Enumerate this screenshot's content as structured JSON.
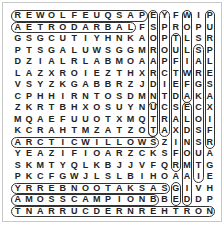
{
  "puzzle": {
    "type": "word-search",
    "rows": 18,
    "cols": 18,
    "grid": [
      "REWOLFEUQSAPEYFWIP",
      "AETRODARBALFSPROPU",
      "GSGCUTIYHNKAOPTLSR",
      "PTSGALUWSGGMROULSP",
      "DZIALRLABMOAAPFIAL",
      "LAZXROIEZTHXRCTWRE",
      "VSYZKGABBRZJDIEFGS",
      "CPHHIRNTOSDMNTDAKA",
      "ZKRTBHXOSUYNUCSECX",
      "MQAEFUUOTXMQTRALOI",
      "KCRAHTMZATZOTAXDSF",
      "ARCTICWILLOWSZINSR",
      "YEAZIFIOARZCKSFOUA",
      "SKMTYQLKBJJVFQRMTG",
      "PKCFGWJLSLBIHOAAIE",
      "YRREBNOOTAKSASGIVH",
      "AMOSSCAMPIONBBEDDP",
      "TNARRUCDERNREHTRON"
    ],
    "highlights": [
      {
        "name": "row1",
        "r": 0,
        "c1": 0,
        "c2": 11,
        "dir": "h"
      },
      {
        "name": "row2",
        "r": 1,
        "c1": 0,
        "c2": 10,
        "dir": "h"
      },
      {
        "name": "arcticwillow",
        "r": 11,
        "c1": 0,
        "c2": 12,
        "dir": "h"
      },
      {
        "name": "row16",
        "r": 15,
        "c1": 0,
        "c2": 13,
        "dir": "h"
      },
      {
        "name": "mosscampion",
        "r": 16,
        "c1": 0,
        "c2": 12,
        "dir": "h"
      },
      {
        "name": "row18",
        "r": 17,
        "c1": 0,
        "c2": 17,
        "dir": "h"
      },
      {
        "name": "col12",
        "c": 12,
        "r1": 0,
        "r2": 10,
        "dir": "v"
      },
      {
        "name": "col13",
        "c": 13,
        "r1": 0,
        "r2": 10,
        "dir": "v"
      },
      {
        "name": "col15",
        "c": 15,
        "r1": 0,
        "r2": 7,
        "dir": "v"
      },
      {
        "name": "col17",
        "c": 17,
        "r1": 0,
        "r2": 11,
        "dir": "v"
      },
      {
        "name": "col14",
        "c": 14,
        "r1": 2,
        "r2": 13,
        "dir": "v"
      },
      {
        "name": "col16",
        "c": 16,
        "r1": 3,
        "r2": 14,
        "dir": "v"
      },
      {
        "name": "col15b",
        "c": 15,
        "r1": 8,
        "r2": 16,
        "dir": "v"
      },
      {
        "name": "col14b",
        "c": 14,
        "r1": 15,
        "r2": 16,
        "dir": "v"
      },
      {
        "name": "col12b",
        "c": 12,
        "r1": 8,
        "r2": 10,
        "dir": "v"
      }
    ]
  }
}
